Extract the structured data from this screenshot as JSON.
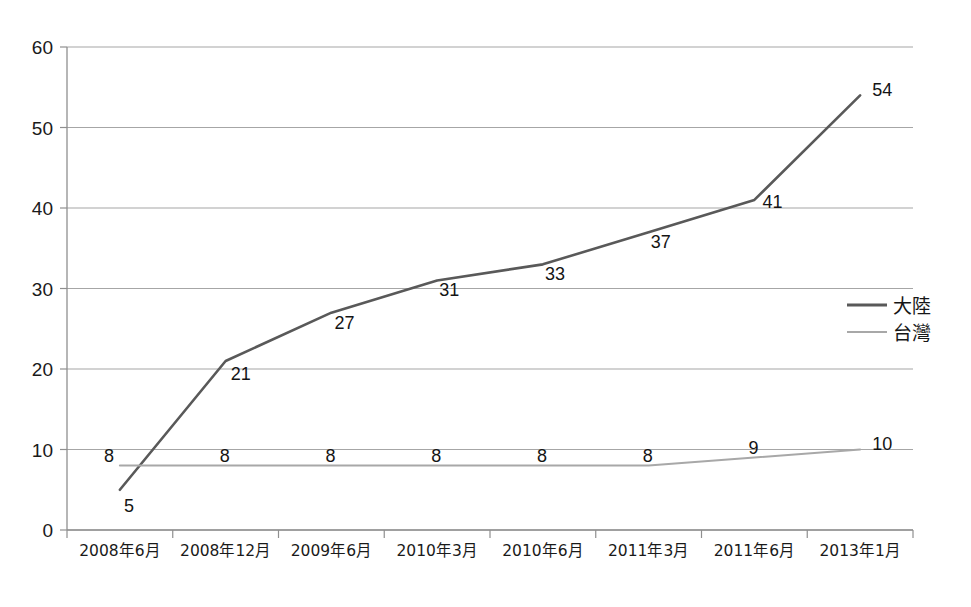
{
  "chart_data": {
    "type": "line",
    "title": "",
    "subtitle": "",
    "xlabel": "",
    "ylabel": "",
    "categories": [
      "2008年6月",
      "2008年12月",
      "2009年6月",
      "2010年3月",
      "2010年6月",
      "2011年3月",
      "2011年6月",
      "2013年1月"
    ],
    "series": [
      {
        "name": "大陸",
        "color": "#595959",
        "line_width": 2.6,
        "values": [
          5,
          21,
          27,
          31,
          33,
          37,
          41,
          54
        ],
        "labels": [
          "5",
          "21",
          "27",
          "31",
          "33",
          "37",
          "41",
          "54"
        ]
      },
      {
        "name": "台灣",
        "color": "#a8a8a8",
        "line_width": 2.0,
        "values": [
          8,
          8,
          8,
          8,
          8,
          8,
          9,
          10
        ],
        "labels": [
          "8",
          "8",
          "8",
          "8",
          "8",
          "8",
          "9",
          "10"
        ]
      }
    ],
    "ylim": [
      0,
      60
    ],
    "ytick_step": 10,
    "yticks": [
      "0",
      "10",
      "20",
      "30",
      "40",
      "50",
      "60"
    ],
    "grid": true,
    "legend_position": "right"
  },
  "legend": {
    "entries": [
      {
        "label": "大陸",
        "color": "#595959"
      },
      {
        "label": "台灣",
        "color": "#a8a8a8"
      }
    ]
  },
  "colors": {
    "mainland_line": "#595959",
    "taiwan_line": "#a8a8a8",
    "gridline": "#a6a6a6",
    "axis": "#8f8f8f",
    "text": "#1a1a1a",
    "background": "#ffffff"
  }
}
